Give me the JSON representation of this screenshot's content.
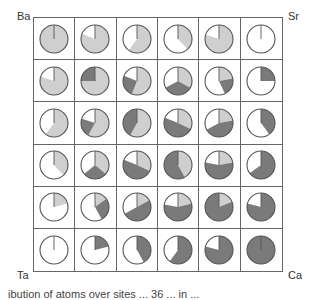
{
  "corners": {
    "top_left": "Ba",
    "top_right": "Sr",
    "bottom_left": "Ta",
    "bottom_right": "Ca"
  },
  "colors": {
    "light": "#cfcfcf",
    "dark": "#7a7a7a",
    "empty": "#ffffff",
    "outline": "#555555",
    "grid": "#666666"
  },
  "caption": "ibution of atoms over sites ... 36 ... in ...",
  "chart_data": {
    "type": "pie",
    "layout": "6x6 grid of pie glyphs",
    "corner_labels": [
      "Ba",
      "Sr",
      "Ta",
      "Ca"
    ],
    "legend": [
      "light gray segment",
      "dark gray segment",
      "white (remainder)"
    ],
    "note": "Each cell: fractions [light, dark], clockwise from 12 o'clock; remainder is white.",
    "rows": [
      [
        [
          1.0,
          0.0
        ],
        [
          0.81,
          0.0
        ],
        [
          0.6,
          0.0
        ],
        [
          0.38,
          0.0
        ],
        [
          0.8,
          0.0
        ],
        [
          0.0,
          0.0
        ]
      ],
      [
        [
          0.8,
          0.0
        ],
        [
          0.75,
          0.25
        ],
        [
          0.56,
          0.25
        ],
        [
          0.33,
          0.34
        ],
        [
          0.22,
          0.21
        ],
        [
          0.0,
          0.25
        ]
      ],
      [
        [
          0.6,
          0.0
        ],
        [
          0.58,
          0.22
        ],
        [
          0.58,
          0.42
        ],
        [
          0.32,
          0.49
        ],
        [
          0.22,
          0.45
        ],
        [
          0.0,
          0.4
        ]
      ],
      [
        [
          0.38,
          0.0
        ],
        [
          0.36,
          0.28
        ],
        [
          0.32,
          0.49
        ],
        [
          0.42,
          0.58
        ],
        [
          0.22,
          0.56
        ],
        [
          0.0,
          0.65
        ]
      ],
      [
        [
          0.21,
          0.0
        ],
        [
          0.15,
          0.27
        ],
        [
          0.17,
          0.5
        ],
        [
          0.21,
          0.57
        ],
        [
          0.19,
          0.81
        ],
        [
          0.0,
          0.79
        ]
      ],
      [
        [
          0.0,
          0.0
        ],
        [
          0.0,
          0.21
        ],
        [
          0.0,
          0.42
        ],
        [
          0.0,
          0.6
        ],
        [
          0.0,
          0.79
        ],
        [
          0.0,
          1.0
        ]
      ]
    ]
  }
}
